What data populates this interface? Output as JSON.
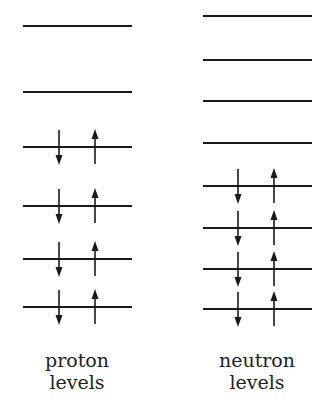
{
  "diagram": {
    "columns": [
      {
        "id": "proton",
        "label_line1": "proton",
        "label_line2": "levels",
        "x1": 23,
        "x2": 132,
        "arrow_down_x": 59,
        "arrow_up_x": 95,
        "levels": [
          {
            "y": 26,
            "filled": false
          },
          {
            "y": 92,
            "filled": false
          },
          {
            "y": 147,
            "filled": true
          },
          {
            "y": 206,
            "filled": true
          },
          {
            "y": 259,
            "filled": true
          },
          {
            "y": 307,
            "filled": true
          }
        ]
      },
      {
        "id": "neutron",
        "label_line1": "neutron",
        "label_line2": "levels",
        "x1": 203,
        "x2": 312,
        "arrow_down_x": 238,
        "arrow_up_x": 274,
        "levels": [
          {
            "y": 16,
            "filled": false
          },
          {
            "y": 60,
            "filled": false
          },
          {
            "y": 101,
            "filled": false
          },
          {
            "y": 143,
            "filled": false
          },
          {
            "y": 186,
            "filled": true
          },
          {
            "y": 228,
            "filled": true
          },
          {
            "y": 269,
            "filled": true
          },
          {
            "y": 309,
            "filled": true
          }
        ]
      }
    ],
    "line_color": "#1a1a1a"
  }
}
